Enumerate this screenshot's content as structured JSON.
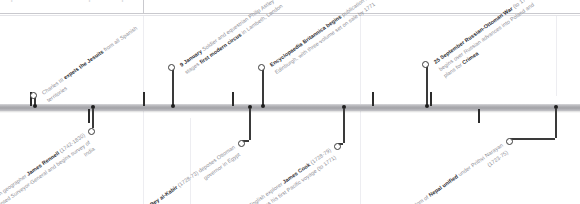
{
  "page": {
    "header_ghost_left": "Spread continues from previous page",
    "header_ghost_right": "1769"
  },
  "timeline": {
    "bar_label": "timeline-axis",
    "ticks_above": [
      30,
      143,
      232,
      372,
      430
    ],
    "ticks_below": [
      88,
      249,
      343,
      478,
      555
    ]
  },
  "events": [
    {
      "id": "jesuits",
      "position": "above",
      "node_x": 30,
      "node_y": 92,
      "stem_x": 34,
      "stem_top": 95,
      "stem_bottom": 106,
      "caption_x": 40,
      "caption_y": 90,
      "date": "",
      "lead": "Charles III ",
      "bold1": "expels the Jesuits",
      "tail": " from all Spanish territories"
    },
    {
      "id": "circus",
      "position": "above",
      "node_x": 168,
      "node_y": 64,
      "stem_x": 172,
      "stem_top": 68,
      "stem_bottom": 106,
      "caption_x": 178,
      "caption_y": 62,
      "date": "9 January",
      "lead": " Soldier and equestrian Philip Astley stages ",
      "bold1": "first modern circus",
      "tail": " in Lambeth, London"
    },
    {
      "id": "britannica",
      "position": "above",
      "node_x": 258,
      "node_y": 64,
      "stem_x": 262,
      "stem_top": 68,
      "stem_bottom": 106,
      "caption_x": 268,
      "caption_y": 62,
      "date": "",
      "lead": "",
      "bold1": "Encyclopaedia Britannica begins",
      "tail": " publication in Edinburgh, with three-volume set on sale by 1771"
    },
    {
      "id": "russo-ottoman",
      "position": "above",
      "node_x": 422,
      "node_y": 61,
      "stem_x": 426,
      "stem_top": 65,
      "stem_bottom": 106,
      "caption_x": 432,
      "caption_y": 59,
      "date": "25 September",
      "lead": " ",
      "bold1": "Russian-Ottoman War",
      "tail": " (to 1774) begins over Russian advances into Poland and plans for ",
      "bold2": "Crimea"
    },
    {
      "id": "rennell",
      "position": "below",
      "node_x": 88,
      "node_y": 128,
      "stem_x": 92,
      "stem_top": 109,
      "stem_bottom": 128,
      "caption_x": 82,
      "caption_y": 131,
      "date": "",
      "lead": "English geographer ",
      "bold1": "James Rennell",
      "tail": " (1742-1830) appointed Surveyor-General and begins survey of India"
    },
    {
      "id": "ali-bey",
      "position": "below",
      "node_x": 238,
      "node_y": 140,
      "stem_x": 249,
      "stem_top": 109,
      "stem_bottom": 140,
      "caption_x": 232,
      "caption_y": 143,
      "date": "",
      "lead": "",
      "bold1": "Ali Bey al-Kabir",
      "tail": " (1728-73) deposes Ottoman governor in Egypt"
    },
    {
      "id": "cook",
      "position": "below",
      "node_x": 334,
      "node_y": 143,
      "stem_x": 343,
      "stem_top": 109,
      "stem_bottom": 143,
      "caption_x": 328,
      "caption_y": 146,
      "date": "25 August",
      "lead": " English explorer ",
      "bold1": "James Cook",
      "tail": " (1728-79) begins his first Pacific voyage (to 1771)"
    },
    {
      "id": "nepal",
      "position": "below",
      "node_x": 506,
      "node_y": 138,
      "stem_x": 555,
      "stem_top": 109,
      "stem_bottom": 138,
      "caption_x": 500,
      "caption_y": 141,
      "date": "",
      "lead": "Kingdom of ",
      "bold1": "Nepal unified",
      "tail": " under Prithvi Narayan (1723-75)"
    }
  ],
  "colors": {
    "bar": "#b0b0b5",
    "tick": "#2b2b2b",
    "caption_text": "#8d8d95",
    "caption_bold": "#2e2e33",
    "page_bg": "#ffffff"
  }
}
